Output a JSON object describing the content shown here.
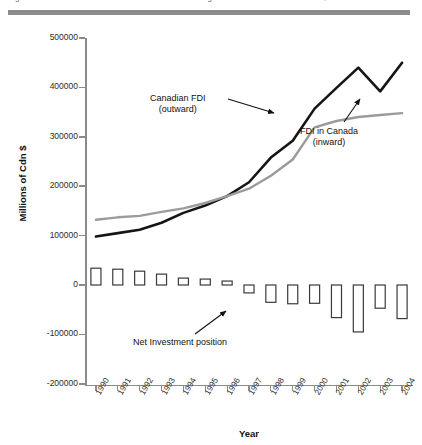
{
  "page": {
    "cropped_caption": "Figure 2   Canadian direct investment abroad and foreign direct investment in Canada, 1990-2004"
  },
  "chart_data": {
    "type": "line",
    "title": "",
    "xlabel": "Year",
    "ylabel": "Millions of Cdn $",
    "ylim": [
      -200000,
      500000
    ],
    "ytick_labels": [
      "500000",
      "400000",
      "300000",
      "200000",
      "100000",
      "0",
      "-100000",
      "-200000"
    ],
    "ytick_values": [
      500000,
      400000,
      300000,
      200000,
      100000,
      0,
      -100000,
      -200000
    ],
    "grid": false,
    "legend_position": "inline-annotations",
    "categories": [
      "1990",
      "1991",
      "1992",
      "1993",
      "1994",
      "1995",
      "1996",
      "1997",
      "1998",
      "1999",
      "2000",
      "2001",
      "2002",
      "2003",
      "2004"
    ],
    "series": [
      {
        "name": "Canadian FDI (outward)",
        "type": "line",
        "color": "#151515",
        "values": [
          98000,
          105000,
          112000,
          126000,
          146000,
          161000,
          180000,
          208000,
          258000,
          292000,
          357000,
          399000,
          440000,
          392000,
          450000
        ]
      },
      {
        "name": "FDI in Canada (inward)",
        "type": "line",
        "color": "#9b9b9b",
        "values": [
          132000,
          137000,
          140000,
          148000,
          155000,
          166000,
          180000,
          195000,
          221000,
          254000,
          319000,
          332000,
          340000,
          344000,
          348000
        ]
      },
      {
        "name": "Net Investment position",
        "type": "bar",
        "color": "#ffffff",
        "edge_color": "#3a3a3a",
        "values": [
          34000,
          32000,
          28000,
          22000,
          14000,
          12000,
          8000,
          -16000,
          -35000,
          -38000,
          -37000,
          -66000,
          -95000,
          -47000,
          -68000
        ]
      }
    ],
    "annotations": [
      {
        "name": "outward-annotation",
        "label_line1": "Canadian FDI",
        "label_line2": "(outward)"
      },
      {
        "name": "inward-annotation",
        "label_line1": "FDI in Canada",
        "label_line2": "(inward)"
      },
      {
        "name": "net-annotation",
        "label_line1": "Net Investment position",
        "label_line2": ""
      }
    ]
  }
}
